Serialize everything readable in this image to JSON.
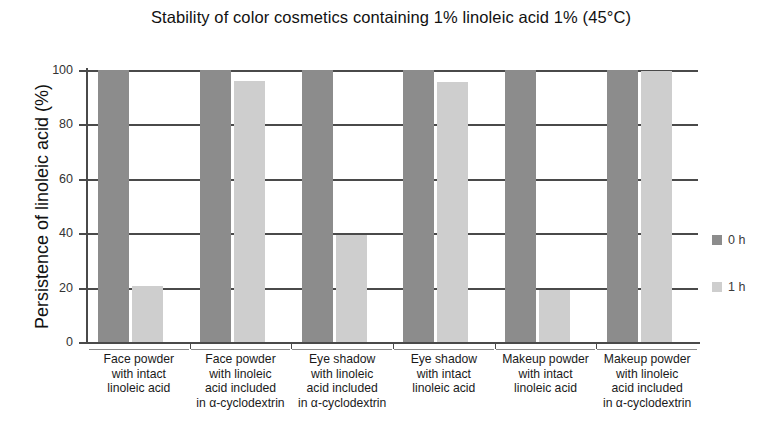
{
  "chart_data": {
    "type": "bar",
    "title": "Stability of color cosmetics containing 1% linoleic acid 1% (45°C)",
    "xlabel": "",
    "ylabel": "Persistence of linoleic acid (%)",
    "ylim": [
      0,
      100
    ],
    "yticks": [
      0,
      20,
      40,
      60,
      80,
      100
    ],
    "ytick_labels": [
      "0",
      "20",
      "40",
      "60",
      "80",
      "100"
    ],
    "grid": true,
    "legend_position": "right",
    "categories": [
      "Face powder with intact linoleic acid",
      "Face powder with linoleic acid included in α-cyclodextrin",
      "Eye shadow with linoleic acid included in α-cyclodextrin",
      "Eye shadow with intact linoleic acid",
      "Makeup powder with intact linoleic acid",
      "Makeup powder with linoleic acid included in α-cyclodextrin"
    ],
    "category_lines": [
      [
        "Face powder",
        "with intact",
        "linoleic acid"
      ],
      [
        "Face powder",
        "with linoleic",
        "acid included",
        "in α-cyclodextrin"
      ],
      [
        "Eye shadow",
        "with linoleic",
        "acid included",
        "in α-cyclodextrin"
      ],
      [
        "Eye shadow",
        "with intact",
        "linoleic acid"
      ],
      [
        "Makeup powder",
        "with intact",
        "linoleic acid"
      ],
      [
        "Makeup powder",
        "with linoleic",
        "acid included",
        "in α-cyclodextrin"
      ]
    ],
    "series": [
      {
        "name": "0 h",
        "color": "#8c8c8c",
        "values": [
          100,
          100,
          100,
          100,
          100,
          100
        ]
      },
      {
        "name": "1 h",
        "color": "#cecece",
        "values": [
          20.5,
          96,
          39.5,
          95.5,
          19,
          99.5
        ]
      }
    ]
  },
  "legend": {
    "items": [
      {
        "label": "0 h",
        "color": "#8c8c8c"
      },
      {
        "label": "1 h",
        "color": "#cecece"
      }
    ]
  },
  "axis": {
    "y_label": "Persistence of linoleic acid (%)",
    "y_tick_labels": [
      "100",
      "80",
      "60",
      "40",
      "20",
      "0"
    ]
  }
}
